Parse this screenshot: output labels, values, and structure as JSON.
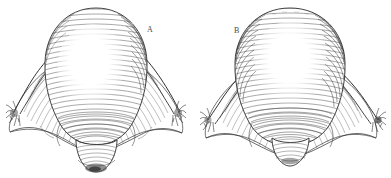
{
  "plate": {
    "title": "Anatomical engraving of two uterine specimens",
    "background_color": "#ffffff",
    "ink_color": "#3a3a3a",
    "width": 391,
    "height": 178,
    "style": "line engraving with curved hatching"
  },
  "figures": [
    {
      "label": "A",
      "label_x": 147,
      "label_y": 26,
      "caption": "A",
      "center_x": 96,
      "parts": [
        "uterine fundus",
        "fallopian tube left",
        "fallopian tube right",
        "fimbriae left",
        "fimbriae right",
        "broad ligament left",
        "broad ligament right",
        "cervix"
      ]
    },
    {
      "label": "B",
      "label_x": 234,
      "label_y": 27,
      "caption": "B",
      "center_x": 290,
      "parts": [
        "uterine fundus",
        "fallopian tube left",
        "fallopian tube right",
        "fimbriae left",
        "fimbriae right",
        "broad ligament left",
        "broad ligament right",
        "cervix"
      ]
    }
  ]
}
